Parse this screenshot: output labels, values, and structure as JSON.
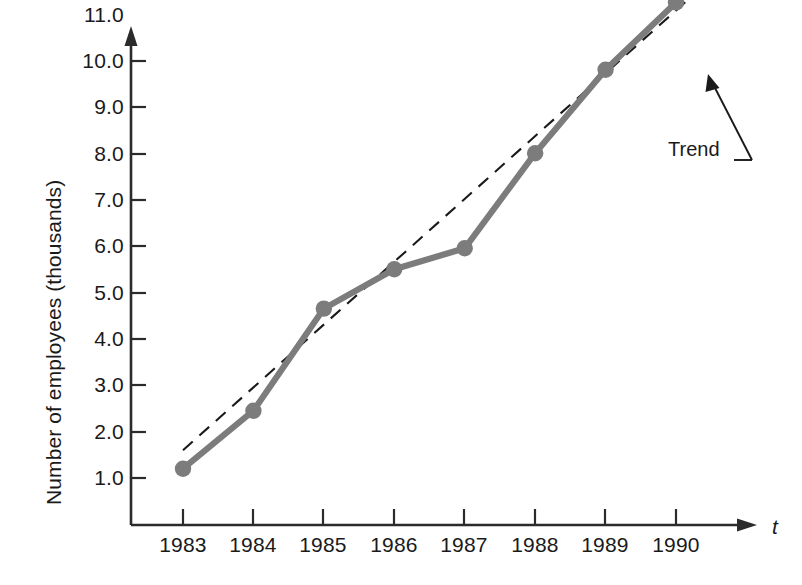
{
  "chart_data": {
    "type": "line",
    "title": "",
    "subtitle": "",
    "xlabel": "t",
    "ylabel": "Number of employees (thousands)",
    "categories": [
      "1983",
      "1984",
      "1985",
      "1986",
      "1987",
      "1988",
      "1989",
      "1990"
    ],
    "x": [
      1983,
      1984,
      1985,
      1986,
      1987,
      1988,
      1989,
      1990
    ],
    "xtick_labels": [
      "1983",
      "1984",
      "1985",
      "1986",
      "1987",
      "1988",
      "1989",
      "1990"
    ],
    "ytick_labels": [
      "1.0",
      "2.0",
      "3.0",
      "4.0",
      "5.0",
      "6.0",
      "7.0",
      "8.0",
      "9.0",
      "10.0",
      "11.0"
    ],
    "ytick_values": [
      1.0,
      2.0,
      3.0,
      4.0,
      5.0,
      6.0,
      7.0,
      8.0,
      9.0,
      10.0,
      11.0
    ],
    "ylim": [
      0.0,
      11.6
    ],
    "xlim": [
      1982.6,
      1990.6
    ],
    "grid": false,
    "legend_position": "none",
    "series": [
      {
        "name": "Number of employees",
        "style": "solid-with-markers",
        "color": "#7c7c7c",
        "values": [
          1.2,
          2.45,
          4.65,
          5.5,
          5.95,
          8.0,
          9.8,
          11.25
        ]
      },
      {
        "name": "Trend",
        "style": "dashed",
        "color": "#1a1a1a",
        "values": [
          1.6,
          3.05,
          4.45,
          5.85,
          7.25,
          8.0,
          9.45,
          11.6
        ]
      }
    ],
    "trend_line": {
      "label": "Trend",
      "x_start": 1983,
      "y_start": 1.6,
      "x_end": 1990.35,
      "y_end": 11.55
    },
    "annotations": [
      {
        "text": "Trend",
        "type": "leader-arrow",
        "points_to": "trend-line"
      }
    ]
  },
  "axis": {
    "y_arrow": true,
    "x_arrow": true,
    "x_axis_name": "t"
  }
}
